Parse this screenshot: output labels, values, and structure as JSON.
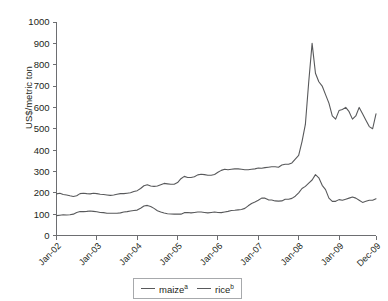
{
  "top_caption": "",
  "axes": {
    "ylabel": "US$/metric ton",
    "ytick_labels": [
      "0",
      "100",
      "200",
      "300",
      "400",
      "500",
      "600",
      "700",
      "800",
      "900",
      "1000"
    ],
    "xtick_labels": [
      "Jan-02",
      "Jan-03",
      "Jan-04",
      "Jan-05",
      "Jan-06",
      "Jan-07",
      "Jan-08",
      "Jan-09",
      "Dec-09"
    ]
  },
  "legend": {
    "items": [
      {
        "label": "maize",
        "superscript": "a",
        "color": "#58595b"
      },
      {
        "label": "rice",
        "superscript": "b",
        "color": "#58595b"
      }
    ]
  },
  "colors": {
    "line": "#58595b",
    "axis": "#6d6e71",
    "text": "#231f20",
    "background": "#ffffff"
  },
  "chart_data": {
    "type": "line",
    "title": "",
    "xlabel": "",
    "ylabel": "US$/metric ton",
    "ylim": [
      0,
      1000
    ],
    "ytick_step": 100,
    "grid": false,
    "legend_position": "bottom-center",
    "x_start": "Jan-02",
    "x_end": "Dec-09",
    "x_frequency": "monthly",
    "categories": [
      "Jan-02",
      "Feb-02",
      "Mar-02",
      "Apr-02",
      "May-02",
      "Jun-02",
      "Jul-02",
      "Aug-02",
      "Sep-02",
      "Oct-02",
      "Nov-02",
      "Dec-02",
      "Jan-03",
      "Feb-03",
      "Mar-03",
      "Apr-03",
      "May-03",
      "Jun-03",
      "Jul-03",
      "Aug-03",
      "Sep-03",
      "Oct-03",
      "Nov-03",
      "Dec-03",
      "Jan-04",
      "Feb-04",
      "Mar-04",
      "Apr-04",
      "May-04",
      "Jun-04",
      "Jul-04",
      "Aug-04",
      "Sep-04",
      "Oct-04",
      "Nov-04",
      "Dec-04",
      "Jan-05",
      "Feb-05",
      "Mar-05",
      "Apr-05",
      "May-05",
      "Jun-05",
      "Jul-05",
      "Aug-05",
      "Sep-05",
      "Oct-05",
      "Nov-05",
      "Dec-05",
      "Jan-06",
      "Feb-06",
      "Mar-06",
      "Apr-06",
      "May-06",
      "Jun-06",
      "Jul-06",
      "Aug-06",
      "Sep-06",
      "Oct-06",
      "Nov-06",
      "Dec-06",
      "Jan-07",
      "Feb-07",
      "Mar-07",
      "Apr-07",
      "May-07",
      "Jun-07",
      "Jul-07",
      "Aug-07",
      "Sep-07",
      "Oct-07",
      "Nov-07",
      "Dec-07",
      "Jan-08",
      "Feb-08",
      "Mar-08",
      "Apr-08",
      "May-08",
      "Jun-08",
      "Jul-08",
      "Aug-08",
      "Sep-08",
      "Oct-08",
      "Nov-08",
      "Dec-08",
      "Jan-09",
      "Feb-09",
      "Mar-09",
      "Apr-09",
      "May-09",
      "Jun-09",
      "Jul-09",
      "Aug-09",
      "Sep-09",
      "Oct-09",
      "Nov-09",
      "Dec-09"
    ],
    "series": [
      {
        "name": "maize",
        "superscript": "a",
        "color": "#58595b",
        "values": [
          93,
          95,
          97,
          96,
          97,
          100,
          108,
          112,
          112,
          113,
          115,
          113,
          111,
          108,
          107,
          104,
          104,
          104,
          104,
          106,
          110,
          112,
          115,
          117,
          119,
          128,
          138,
          141,
          136,
          127,
          116,
          110,
          105,
          102,
          101,
          100,
          101,
          100,
          107,
          108,
          106,
          108,
          110,
          110,
          108,
          106,
          108,
          110,
          108,
          107,
          110,
          113,
          117,
          118,
          120,
          122,
          127,
          139,
          150,
          157,
          165,
          175,
          175,
          167,
          166,
          162,
          161,
          162,
          170,
          170,
          174,
          184,
          200,
          220,
          230,
          245,
          260,
          285,
          270,
          235,
          215,
          175,
          160,
          160,
          168,
          165,
          170,
          175,
          180,
          175,
          165,
          155,
          160,
          165,
          165,
          172
        ]
      },
      {
        "name": "rice",
        "superscript": "b",
        "color": "#58595b",
        "values": [
          195,
          198,
          192,
          190,
          186,
          183,
          186,
          196,
          198,
          196,
          195,
          198,
          196,
          193,
          192,
          190,
          188,
          190,
          193,
          196,
          196,
          198,
          200,
          206,
          210,
          220,
          233,
          238,
          232,
          230,
          232,
          238,
          244,
          242,
          240,
          240,
          248,
          266,
          277,
          272,
          272,
          275,
          284,
          287,
          285,
          282,
          282,
          286,
          296,
          305,
          310,
          308,
          310,
          312,
          312,
          310,
          308,
          308,
          310,
          312,
          316,
          315,
          318,
          320,
          322,
          322,
          320,
          330,
          334,
          334,
          340,
          358,
          375,
          440,
          520,
          720,
          900,
          760,
          720,
          700,
          660,
          620,
          560,
          545,
          585,
          590,
          600,
          580,
          545,
          560,
          600,
          570,
          540,
          510,
          500,
          570
        ]
      }
    ]
  }
}
